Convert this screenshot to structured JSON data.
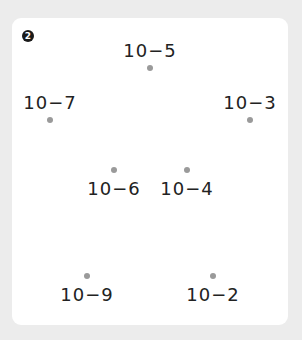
{
  "badge": {
    "number": "2",
    "glyph": "❷"
  },
  "colors": {
    "background": "#ececec",
    "card": "#ffffff",
    "dot": "#9a9a9a",
    "text": "#222222"
  },
  "items": [
    {
      "id": "10-5",
      "label": "10−5",
      "dot": {
        "x": 150,
        "y": 68
      },
      "label_position": "above"
    },
    {
      "id": "10-7",
      "label": "10−7",
      "dot": {
        "x": 50,
        "y": 120
      },
      "label_position": "above"
    },
    {
      "id": "10-3",
      "label": "10−3",
      "dot": {
        "x": 250,
        "y": 120
      },
      "label_position": "above"
    },
    {
      "id": "10-6",
      "label": "10−6",
      "dot": {
        "x": 114,
        "y": 170
      },
      "label_position": "below"
    },
    {
      "id": "10-4",
      "label": "10−4",
      "dot": {
        "x": 187,
        "y": 170
      },
      "label_position": "below"
    },
    {
      "id": "10-9",
      "label": "10−9",
      "dot": {
        "x": 87,
        "y": 276
      },
      "label_position": "below"
    },
    {
      "id": "10-2",
      "label": "10−2",
      "dot": {
        "x": 213,
        "y": 276
      },
      "label_position": "below"
    }
  ]
}
